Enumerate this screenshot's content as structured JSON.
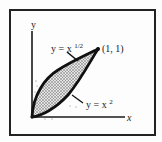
{
  "figure": {
    "type": "region-between-curves",
    "axes": {
      "x_label": "x",
      "y_label": "y"
    },
    "curves": [
      {
        "name": "upper",
        "equation_prefix": "y = x",
        "exponent": "1/2",
        "label": "y = x^(1/2)"
      },
      {
        "name": "lower",
        "equation_prefix": "y = x",
        "exponent": "2",
        "label": "y = x^2"
      }
    ],
    "intersection_point": {
      "label": "(1, 1)",
      "x": 1,
      "y": 1
    },
    "shaded_region": "area between y = x^(1/2) and y = x^2 from x=0 to x=1",
    "colors": {
      "ink": "#1a1a1a",
      "frame": "#222222",
      "shade": "#8a8a8a"
    }
  }
}
